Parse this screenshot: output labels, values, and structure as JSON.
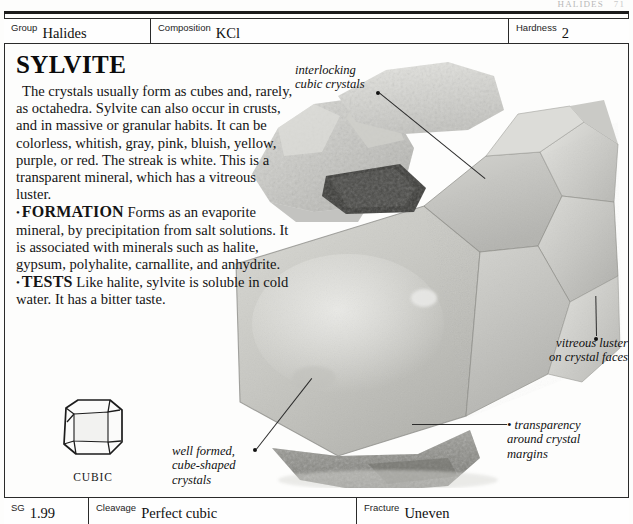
{
  "running_head": {
    "title": "HALIDES",
    "folio": "71"
  },
  "header_row": {
    "fields": [
      {
        "label": "Group",
        "value": "Halides"
      },
      {
        "label": "Composition",
        "value": "KCl"
      },
      {
        "label": "Hardness",
        "value": "2"
      }
    ]
  },
  "article": {
    "title": "SYLVITE",
    "intro": "The crystals usually form as cubes and, rarely, as octahedra. Sylvite can also occur in crusts, and in massive or granular habits. It can be colorless, whitish, gray, pink, bluish, yellow, purple, or red. The streak is white. This is a transparent mineral, which has a vitreous luster.",
    "sections": [
      {
        "bullet": "•",
        "kicker": "FORMATION",
        "text": "Forms as an evaporite mineral, by precipitation from salt solutions. It is associated with minerals such as halite, gypsum, polyhalite, carnallite, and anhydrite."
      },
      {
        "bullet": "•",
        "kicker": "TESTS",
        "text": "Like halite, sylvite is soluble in cold water. It has a bitter taste."
      }
    ]
  },
  "habit_diagram": {
    "caption": "CUBIC",
    "icon": "cube-crystal-icon"
  },
  "specimen": {
    "icon": "sylvite-specimen-photo",
    "alt": "Grayscale photograph of a sylvite specimen of interlocking translucent cubic crystals on a granular rock matrix"
  },
  "callouts": [
    {
      "id": "interlocking-cubic-crystals",
      "lines": [
        "interlocking",
        "cubic crystals"
      ],
      "align": "left",
      "dot": "leader-dot"
    },
    {
      "id": "vitreous-luster",
      "lines": [
        "vitreous luster",
        "on crystal faces"
      ],
      "align": "right",
      "dot": "leader-dot"
    },
    {
      "id": "transparency-margins",
      "lines": [
        "• transparency",
        "around crystal",
        "margins"
      ],
      "align": "left",
      "dot": "bullet-dot"
    },
    {
      "id": "well-formed-crystals",
      "lines": [
        "well formed,",
        "cube-shaped",
        "crystals"
      ],
      "align": "left",
      "dot": "leader-dot"
    }
  ],
  "footer_row": {
    "fields": [
      {
        "label": "SG",
        "value": "1.99"
      },
      {
        "label": "Cleavage",
        "value": "Perfect cubic"
      },
      {
        "label": "Fracture",
        "value": "Uneven"
      }
    ]
  },
  "colors": {
    "rule": "#1b1b1b",
    "text": "#111111",
    "paper": "#fdfdfc"
  }
}
